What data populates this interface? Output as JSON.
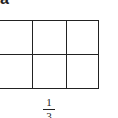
{
  "figure": {
    "label": "a",
    "grid": {
      "rows": 2,
      "columns": 3
    },
    "fraction": {
      "numerator": "1",
      "denominator": "3"
    }
  }
}
